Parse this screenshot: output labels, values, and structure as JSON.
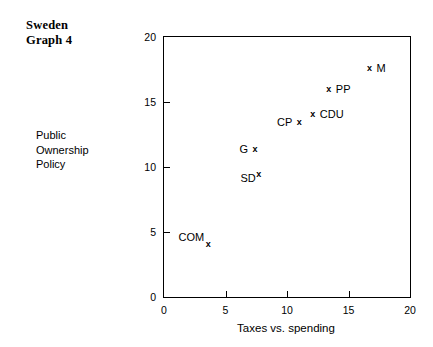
{
  "title": {
    "line1": "Sweden",
    "line2": "Graph 4"
  },
  "side_label": {
    "line1": "Public",
    "line2": "Ownership",
    "line3": "Policy"
  },
  "chart_data": {
    "type": "scatter",
    "title": "Sweden Graph 4",
    "xlabel": "Taxes vs. spending",
    "ylabel": "Public Ownership Policy",
    "xlim": [
      0,
      20
    ],
    "ylim": [
      0,
      20
    ],
    "xticks": [
      "0",
      "5",
      "10",
      "15",
      "20"
    ],
    "yticks": [
      "0",
      "5",
      "10",
      "15",
      "20"
    ],
    "grid": false,
    "legend": "none",
    "marker": "x",
    "points": [
      {
        "label": "COM",
        "x": 3.6,
        "y": 4.1,
        "label_pos": "upperleft"
      },
      {
        "label": "SD",
        "x": 7.7,
        "y": 9.5,
        "label_pos": "lowerleft"
      },
      {
        "label": "G",
        "x": 7.4,
        "y": 11.4,
        "label_pos": "left"
      },
      {
        "label": "CP",
        "x": 11.0,
        "y": 13.5,
        "label_pos": "left"
      },
      {
        "label": "CDU",
        "x": 12.1,
        "y": 14.1,
        "label_pos": "right"
      },
      {
        "label": "PP",
        "x": 13.4,
        "y": 16.0,
        "label_pos": "right"
      },
      {
        "label": "M",
        "x": 16.7,
        "y": 17.6,
        "label_pos": "right"
      }
    ]
  },
  "colors": {
    "background": "#ffffff",
    "foreground": "#000000"
  }
}
